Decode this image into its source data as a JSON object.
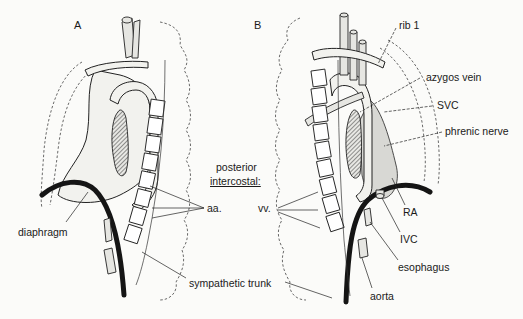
{
  "figure": {
    "panels": [
      {
        "id": "A",
        "label": "A"
      },
      {
        "id": "B",
        "label": "B"
      }
    ],
    "center_caption": {
      "line1": "posterior",
      "line2": "intercostal:"
    },
    "labels": {
      "diaphragm": "diaphragm",
      "aa": "aa.",
      "vv": "vv.",
      "sympathetic_trunk": "sympathetic trunk",
      "rib1": "rib 1",
      "azygos_vein": "azygos vein",
      "svc": "SVC",
      "phrenic_nerve": "phrenic nerve",
      "ra": "RA",
      "ivc": "IVC",
      "esophagus": "esophagus",
      "aorta": "aorta"
    }
  }
}
